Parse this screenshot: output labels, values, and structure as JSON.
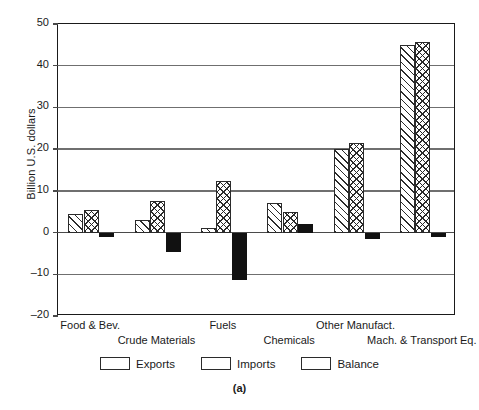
{
  "chart_data": {
    "type": "bar",
    "title": "",
    "caption": "(a)",
    "xlabel": "",
    "ylabel": "Billion U.S. dollars",
    "ylim": [
      -20,
      50
    ],
    "yticks": [
      50,
      40,
      30,
      20,
      10,
      0,
      -10,
      -20
    ],
    "ytick_labels": [
      "50",
      "40",
      "30",
      "20",
      "10",
      "0",
      "–10",
      "–20"
    ],
    "grid": "horizontal",
    "legend_position": "bottom",
    "categories": [
      "Food & Bev.",
      "Crude Materials",
      "Fuels",
      "Chemicals",
      "Other Manufact.",
      "Mach. & Transport Eq."
    ],
    "series": [
      {
        "name": "Exports",
        "pattern": "diagonal-hatch",
        "color": "#ffffff",
        "values": [
          4.5,
          3.0,
          1.0,
          7.0,
          20.0,
          45.0
        ]
      },
      {
        "name": "Imports",
        "pattern": "cross-hatch",
        "color": "#ffffff",
        "values": [
          5.3,
          7.5,
          12.3,
          5.0,
          21.5,
          45.8
        ]
      },
      {
        "name": "Balance",
        "pattern": "solid",
        "color": "#111111",
        "values": [
          -1.0,
          -4.7,
          -11.3,
          2.0,
          -1.5,
          -1.0
        ]
      }
    ]
  },
  "legend": {
    "entries": [
      {
        "label": "Exports"
      },
      {
        "label": "Imports"
      },
      {
        "label": "Balance"
      }
    ]
  }
}
